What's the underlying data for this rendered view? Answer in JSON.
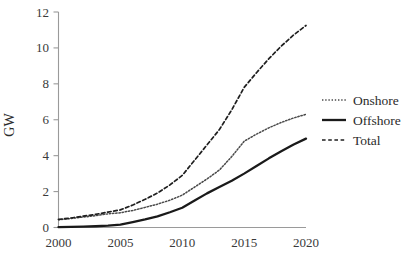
{
  "chart_data": {
    "type": "line",
    "title": "",
    "xlabel": "",
    "ylabel": "GW",
    "x": [
      2000,
      2001,
      2002,
      2003,
      2004,
      2005,
      2006,
      2007,
      2008,
      2009,
      2010,
      2011,
      2012,
      2013,
      2014,
      2015,
      2016,
      2017,
      2018,
      2019,
      2020
    ],
    "xlim": [
      2000,
      2020
    ],
    "ylim": [
      0,
      12
    ],
    "xticks": [
      2000,
      2005,
      2010,
      2015,
      2020
    ],
    "xtick_labels": [
      "2000",
      "2005",
      "2010",
      "2015",
      "2020"
    ],
    "yticks": [
      0,
      2,
      4,
      6,
      8,
      10,
      12
    ],
    "ytick_labels": [
      "0",
      "2",
      "4",
      "6",
      "8",
      "10",
      "12"
    ],
    "grid": false,
    "legend_position": "right",
    "series": [
      {
        "name": "Onshore",
        "style": "dotted",
        "color": "#4a4a4a",
        "values": [
          0.43,
          0.5,
          0.58,
          0.66,
          0.76,
          0.82,
          0.95,
          1.12,
          1.3,
          1.52,
          1.8,
          2.25,
          2.7,
          3.2,
          3.95,
          4.8,
          5.2,
          5.55,
          5.85,
          6.1,
          6.3
        ]
      },
      {
        "name": "Offshore",
        "style": "solid",
        "color": "#1a1a1a",
        "values": [
          0.02,
          0.03,
          0.05,
          0.07,
          0.1,
          0.16,
          0.3,
          0.45,
          0.62,
          0.85,
          1.1,
          1.5,
          1.9,
          2.25,
          2.6,
          3.0,
          3.42,
          3.85,
          4.25,
          4.62,
          4.95
        ]
      },
      {
        "name": "Total",
        "style": "dashed",
        "color": "#1f1f1f",
        "values": [
          0.45,
          0.53,
          0.63,
          0.73,
          0.86,
          0.98,
          1.25,
          1.57,
          1.92,
          2.37,
          2.9,
          3.75,
          4.6,
          5.45,
          6.55,
          7.8,
          8.62,
          9.4,
          10.1,
          10.72,
          11.25
        ]
      }
    ]
  },
  "axes": {
    "y_title": "GW"
  },
  "legend": {
    "entries": [
      {
        "label": "Onshore"
      },
      {
        "label": "Offshore"
      },
      {
        "label": "Total"
      }
    ]
  }
}
